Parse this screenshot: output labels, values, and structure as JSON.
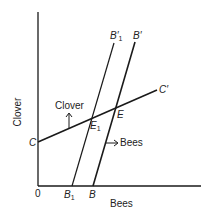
{
  "axes": {
    "y_label": "Clover",
    "x_label": "Bees",
    "origin_label": "0"
  },
  "lines": {
    "clover": {
      "start_label": "C",
      "end_label": "C′"
    },
    "bees": {
      "start_label": "B",
      "end_label": "B′"
    },
    "bees_shifted": {
      "start_label": "B",
      "start_sub": "1",
      "end_label": "B′",
      "end_sub": "1"
    }
  },
  "points": {
    "equilibrium": "E",
    "equilibrium_new": {
      "label": "E",
      "sub": "1"
    }
  },
  "annotations": {
    "clover_arrow": "Clover",
    "bees_arrow": "Bees"
  },
  "colors": {
    "line": "#1a1a1a",
    "background": "#ffffff"
  }
}
